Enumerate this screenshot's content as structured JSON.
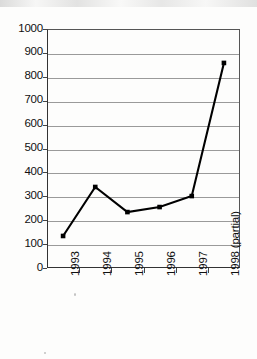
{
  "chart_data": {
    "type": "line",
    "title": "",
    "subtitle": "",
    "xlabel": "",
    "ylabel": "",
    "categories": [
      "1993",
      "1994",
      "1995",
      "1996",
      "1997",
      "1998 (partial)"
    ],
    "values": [
      134,
      339,
      234,
      255,
      301,
      858
    ],
    "series": [
      {
        "name": "",
        "values": [
          134,
          339,
          234,
          255,
          301,
          858
        ]
      }
    ],
    "ylim": [
      0,
      1000
    ],
    "ytick_values": [
      0,
      100,
      200,
      300,
      400,
      500,
      600,
      700,
      800,
      900,
      1000
    ],
    "ytick_labels": [
      "0",
      "100",
      "200",
      "300",
      "400",
      "500",
      "600",
      "700",
      "800",
      "900",
      "1000"
    ],
    "grid": true,
    "grid_axis": "y",
    "legend": false,
    "legend_position": "none",
    "marker": "square",
    "marker_color": "#000000",
    "line_color": "#000000",
    "xtick_label_rotation": -90,
    "annotations": []
  },
  "style": {
    "background_color": "#fdfdfc",
    "axis_color": "#333333",
    "grid_color": "#9a9a9a",
    "text_color": "#111111"
  }
}
